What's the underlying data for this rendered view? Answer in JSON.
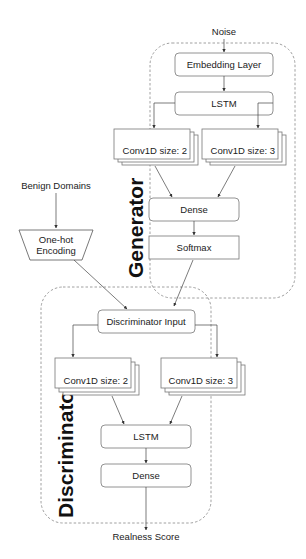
{
  "diagram": {
    "inputs": {
      "noise": "Noise",
      "benign_domains": "Benign Domains"
    },
    "output": "Realness Score",
    "preprocess": {
      "one_hot_line1": "One-hot",
      "one_hot_line2": "Encoding"
    },
    "generator": {
      "title": "Generator",
      "embedding": "Embedding Layer",
      "lstm": "LSTM",
      "conv2": "Conv1D size: 2",
      "conv3": "Conv1D size: 3",
      "dense": "Dense",
      "softmax": "Softmax"
    },
    "discriminator": {
      "title": "Discriminator",
      "input": "Discriminator Input",
      "conv2": "Conv1D size: 2",
      "conv3": "Conv1D size: 3",
      "lstm": "LSTM",
      "dense": "Dense"
    },
    "colors": {
      "stroke": "#777777",
      "dash": "#888888",
      "text": "#222222"
    }
  }
}
